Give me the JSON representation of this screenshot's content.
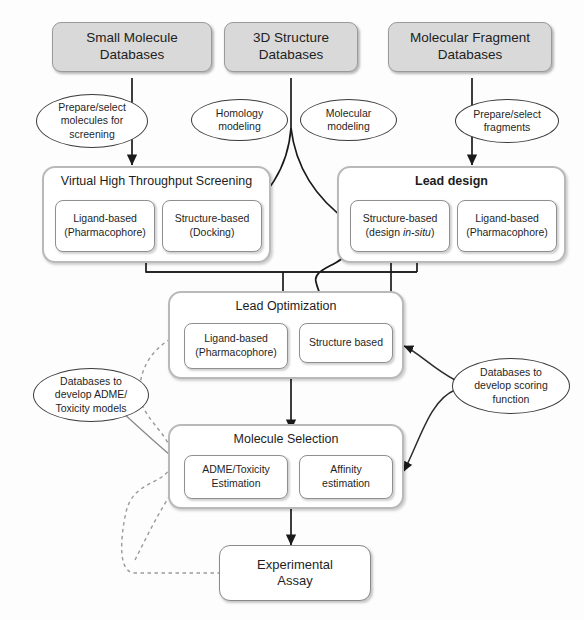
{
  "diagram": {
    "type": "flowchart",
    "colors": {
      "database_fill": "#d9d9d9",
      "database_stroke": "#9a9a9a",
      "stage_stroke": "#b9b9b9",
      "inner_stroke": "#8f8f8f",
      "ellipse_stroke": "#3b3b3b",
      "arrow": "#1a1a1a",
      "dashed_arrow": "#8a8a8a",
      "background": "#fdfdfd"
    }
  },
  "databases": [
    {
      "id": "small-molecule",
      "line1": "Small Molecule",
      "line2": "Databases"
    },
    {
      "id": "3d-structure",
      "line1": "3D Structure",
      "line2": "Databases"
    },
    {
      "id": "molecular-fragment",
      "line1": "Molecular Fragment",
      "line2": "Databases"
    }
  ],
  "annotations": [
    {
      "id": "prepare-molecules",
      "line1": "Prepare/select",
      "line2": "molecules for",
      "line3": "screening"
    },
    {
      "id": "homology-modeling",
      "line1": "Homology",
      "line2": "modeling",
      "line3": ""
    },
    {
      "id": "molecular-modeling",
      "line1": "Molecular",
      "line2": "modeling",
      "line3": ""
    },
    {
      "id": "prepare-fragments",
      "line1": "Prepare/select",
      "line2": "fragments",
      "line3": ""
    },
    {
      "id": "adme-databases",
      "line1": "Databases to",
      "line2": "develop ADME/",
      "line3": "Toxicity models"
    },
    {
      "id": "scoring-databases",
      "line1": "Databases to",
      "line2": "develop scoring",
      "line3": "function"
    }
  ],
  "stages": {
    "vhts": {
      "title": "Virtual High Throughput Screening",
      "methods": [
        {
          "id": "vhts-ligand",
          "line1": "Ligand-based",
          "line2": "(Pharmacophore)"
        },
        {
          "id": "vhts-structure",
          "line1": "Structure-based",
          "line2": "(Docking)"
        }
      ]
    },
    "lead_design": {
      "title": "Lead design",
      "methods": [
        {
          "id": "ld-structure",
          "line1": "Structure-based",
          "line2_pre": "(design ",
          "line2_ital": "in-situ",
          "line2_post": ")"
        },
        {
          "id": "ld-ligand",
          "line1": "Ligand-based",
          "line2": "(Pharmacophore)"
        }
      ]
    },
    "lead_optimization": {
      "title": "Lead Optimization",
      "methods": [
        {
          "id": "lo-ligand",
          "line1": "Ligand-based",
          "line2": "(Pharmacophore)"
        },
        {
          "id": "lo-structure",
          "line1": "Structure based",
          "line2": ""
        }
      ]
    },
    "molecule_selection": {
      "title": "Molecule Selection",
      "methods": [
        {
          "id": "ms-adme",
          "line1": "ADME/Toxicity",
          "line2": "Estimation"
        },
        {
          "id": "ms-affinity",
          "line1": "Affinity",
          "line2": "estimation"
        }
      ]
    }
  },
  "terminal": {
    "id": "experimental-assay",
    "line1": "Experimental",
    "line2": "Assay"
  }
}
